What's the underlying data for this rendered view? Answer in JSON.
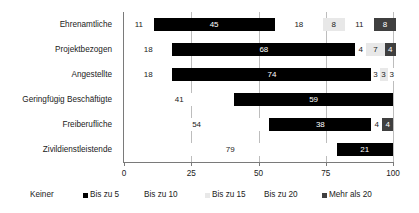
{
  "chart_data": {
    "type": "bar",
    "orientation": "horizontal",
    "stacked": true,
    "stack_mode": "percent",
    "title": "",
    "subtitle": "",
    "xlabel": "",
    "ylabel": "",
    "xlim": [
      0,
      100
    ],
    "xticks": [
      0,
      25,
      50,
      75,
      100
    ],
    "xtick_labels": [
      "0",
      "25",
      "50",
      "75",
      "100"
    ],
    "grid": true,
    "grid_axis": "x",
    "legend_position": "bottom",
    "categories": [
      "Ehrenamtliche",
      "Projektbezogen",
      "Angestellte",
      "Geringfügig Beschäftigte",
      "Freiberufliche",
      "Zivildienstleistende"
    ],
    "series": [
      {
        "name": "Keiner",
        "color": "#ffffff",
        "label_color": "#222222",
        "values": [
          11,
          18,
          18,
          41,
          54,
          79
        ]
      },
      {
        "name": "Bis zu 5",
        "color": "#000000",
        "label_color": "#ffffff",
        "values": [
          45,
          68,
          74,
          59,
          38,
          21
        ]
      },
      {
        "name": "Bis zu 10",
        "color": "#ffffff",
        "label_color": "#222222",
        "values": [
          18,
          4,
          3,
          0,
          4,
          0
        ]
      },
      {
        "name": "Bis zu 15",
        "color": "#e8e8e8",
        "label_color": "#222222",
        "values": [
          8,
          7,
          3,
          0,
          0,
          0
        ]
      },
      {
        "name": "Bis zu 20",
        "color": "#ffffff",
        "label_color": "#222222",
        "values": [
          11,
          0,
          3,
          0,
          0,
          0
        ]
      },
      {
        "name": "Mehr als 20",
        "color": "#3f3f3f",
        "label_color": "#ffffff",
        "values": [
          8,
          4,
          0,
          0,
          4,
          0
        ]
      }
    ]
  },
  "legend": {
    "items": [
      {
        "label": "Keiner",
        "swatch": "#ffffff",
        "show_swatch": false
      },
      {
        "label": "Bis zu 5",
        "swatch": "#000000",
        "show_swatch": true
      },
      {
        "label": "Bis zu 10",
        "swatch": "#ffffff",
        "show_swatch": false
      },
      {
        "label": "Bis zu 15",
        "swatch": "#e8e8e8",
        "show_swatch": true
      },
      {
        "label": "Bis zu 20",
        "swatch": "#ffffff",
        "show_swatch": false
      },
      {
        "label": "Mehr als 20",
        "swatch": "#3f3f3f",
        "show_swatch": true
      }
    ]
  },
  "colors": {
    "axis": "#7a7a7a",
    "grid": "#bdbdbd",
    "text": "#222222",
    "bar_dark": "#000000",
    "bar_mid": "#3f3f3f",
    "bar_light": "#e8e8e8"
  }
}
